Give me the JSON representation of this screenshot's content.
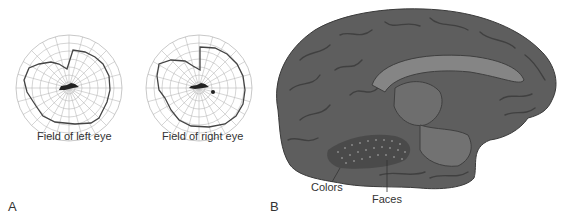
{
  "panel_a": {
    "letter": "A",
    "plots": [
      {
        "caption": "Field of left eye",
        "center": [
          69,
          88
        ],
        "radius": 53
      },
      {
        "caption": "Field of right eye",
        "center": [
          199,
          88
        ],
        "radius": 53
      }
    ]
  },
  "panel_b": {
    "letter": "B",
    "labels": {
      "colors": "Colors",
      "faces": "Faces"
    }
  },
  "colors": {
    "grid": "#b0b0b0",
    "field_line": "#444444",
    "brain_base": "#5e5e5e",
    "brain_dark": "#3f3f3f",
    "brain_light": "#858585",
    "text": "#333333"
  }
}
